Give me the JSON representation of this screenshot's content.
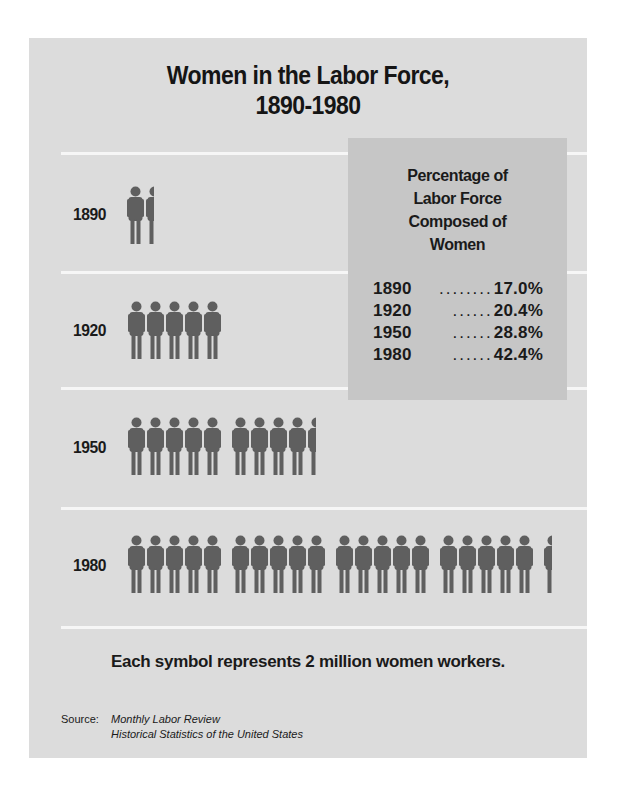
{
  "title_line1": "Women in the Labor Force,",
  "title_line2": "1890-1980",
  "colors": {
    "page_bg": "#ffffff",
    "panel_bg": "#dcdcdc",
    "inset_bg": "#c6c6c6",
    "divider": "#f6f6f6",
    "figure": "#5f5f5f",
    "text": "#1a1a1a"
  },
  "rows": [
    {
      "year": "1890",
      "symbols": 1.5
    },
    {
      "year": "1920",
      "symbols": 5
    },
    {
      "year": "1950",
      "symbols": 9.5
    },
    {
      "year": "1980",
      "symbols": 20.5
    }
  ],
  "inset": {
    "title_lines": [
      "Percentage of",
      "Labor Force",
      "Composed of",
      "Women"
    ],
    "rows": [
      {
        "year": "1890",
        "dots": "........",
        "value": "17.0%"
      },
      {
        "year": "1920",
        "dots": "......",
        "value": "20.4%"
      },
      {
        "year": "1950",
        "dots": "......",
        "value": "28.8%"
      },
      {
        "year": "1980",
        "dots": "......",
        "value": "42.4%"
      }
    ]
  },
  "footnote": "Each symbol represents 2 million women workers.",
  "source": {
    "label": "Source:",
    "line1": "Monthly Labor Review",
    "line2": "Historical Statistics of the United States"
  },
  "chart_data": {
    "type": "pictograph",
    "title": "Women in the Labor Force, 1890-1980",
    "unit": "Each symbol represents 2 million women workers",
    "categories": [
      "1890",
      "1920",
      "1950",
      "1980"
    ],
    "series": [
      {
        "name": "Symbols shown (approx.)",
        "values": [
          1.5,
          5,
          9.5,
          20.5
        ]
      },
      {
        "name": "Women workers (millions, approx.)",
        "values": [
          3,
          10,
          19,
          41
        ]
      },
      {
        "name": "Percentage of Labor Force Composed of Women",
        "values": [
          17.0,
          20.4,
          28.8,
          42.4
        ]
      }
    ],
    "table": {
      "title": "Percentage of Labor Force Composed of Women",
      "rows": [
        [
          "1890",
          "17.0%"
        ],
        [
          "1920",
          "20.4%"
        ],
        [
          "1950",
          "28.8%"
        ],
        [
          "1980",
          "42.4%"
        ]
      ]
    },
    "source": "Monthly Labor Review; Historical Statistics of the United States",
    "grid": false,
    "legend": "none"
  }
}
